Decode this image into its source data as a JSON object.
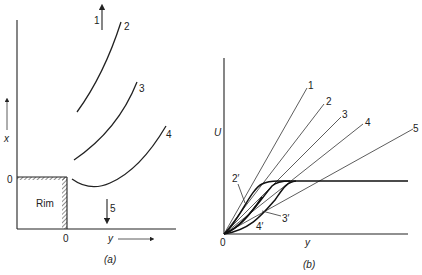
{
  "figure": {
    "panel_a": {
      "caption": "(a)",
      "x_axis_label": "y",
      "y_axis_label": "x",
      "origin_x_label": "0",
      "origin_y_label": "0",
      "rim_label": "Rim",
      "curve_labels": [
        "1",
        "2",
        "3",
        "4",
        "5"
      ]
    },
    "panel_b": {
      "caption": "(b)",
      "x_axis_label": "y",
      "y_axis_label": "U",
      "origin_label": "0",
      "line_labels": [
        "1",
        "2",
        "3",
        "4",
        "5"
      ],
      "profile_labels": [
        "2′",
        "3′",
        "4′"
      ]
    }
  }
}
